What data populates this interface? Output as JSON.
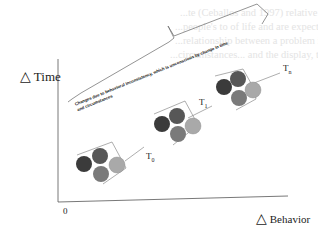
{
  "figure": {
    "y_axis_label": "Time",
    "x_axis_label": "Behavior",
    "delta_symbol": "△",
    "origin_label": "0",
    "annotation_line1": "Changes due to behavioral inconsistency, which is unconscious by change in time",
    "annotation_line2": "and circumstances",
    "time_labels": [
      "T",
      "T",
      "T"
    ],
    "time_subscripts": [
      "0",
      "1",
      "n"
    ],
    "clusters": [
      {
        "label": "T0",
        "cx": 99,
        "cy": 164
      },
      {
        "label": "T1",
        "cx": 178,
        "cy": 120
      },
      {
        "label": "Tn",
        "cx": 248,
        "cy": 80
      }
    ],
    "circle_colors": {
      "left": "#3b3b3b",
      "top": "#575757",
      "bottom": "#7a7a7a",
      "right": "#a9a9a9"
    }
  },
  "background_text": [
    "...te (Ceballos and 1997) relative this rate data that",
    "...people's to of life and are expected to...",
    "...relationship between a problem in terms of...",
    "...circumstances... and the display, their reliance..."
  ]
}
